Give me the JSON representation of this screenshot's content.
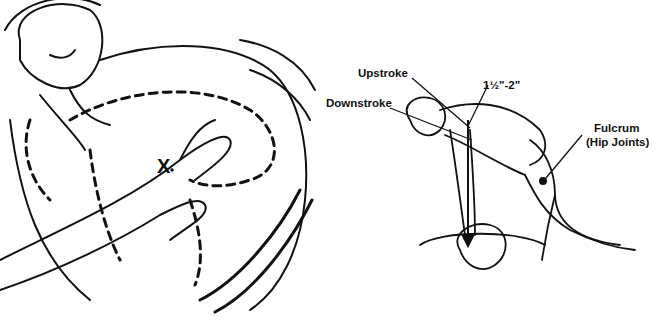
{
  "left_figure": {
    "title": "Hand placement on chest for compressions",
    "marker": "X"
  },
  "right_figure": {
    "title": "Rescuer position with fulcrum at hip joints",
    "labels": {
      "upstroke": "Upstroke",
      "depth": "1½\"-2\"",
      "downstroke": "Downstroke",
      "fulcrum": "Fulcrum",
      "fulcrum_detail": "(Hip Joints)"
    }
  },
  "colors": {
    "line": "#111111",
    "background": "#ffffff"
  }
}
